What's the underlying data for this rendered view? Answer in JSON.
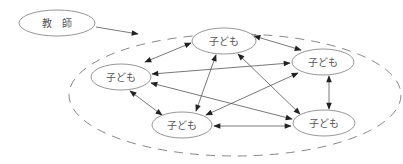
{
  "diagram": {
    "type": "relationship-diagram",
    "teacher": {
      "label": "教　師",
      "cx": 57,
      "cy": 23,
      "rx": 38,
      "ry": 13
    },
    "group": {
      "style": "dashed",
      "cx": 235,
      "cy": 95,
      "rx": 166,
      "ry": 61
    },
    "children": [
      {
        "id": "A",
        "label": "子ども",
        "cx": 224,
        "cy": 41,
        "rx": 32,
        "ry": 13
      },
      {
        "id": "B",
        "label": "子ども",
        "cx": 121,
        "cy": 77,
        "rx": 30,
        "ry": 13
      },
      {
        "id": "C",
        "label": "子ども",
        "cx": 323,
        "cy": 62,
        "rx": 31,
        "ry": 13
      },
      {
        "id": "D",
        "label": "子ども",
        "cx": 182,
        "cy": 125,
        "rx": 30,
        "ry": 13
      },
      {
        "id": "E",
        "label": "子ども",
        "cx": 324,
        "cy": 123,
        "rx": 31,
        "ry": 13
      }
    ],
    "edges": [
      {
        "from": "teacher",
        "to": "group",
        "type": "one-way",
        "x1": 96,
        "y1": 27,
        "x2": 138,
        "y2": 34
      },
      {
        "from": "A",
        "to": "C",
        "type": "two-way",
        "x1": 254,
        "y1": 36,
        "x2": 301,
        "y2": 50
      },
      {
        "from": "A",
        "to": "B",
        "type": "two-way",
        "x1": 191,
        "y1": 43,
        "x2": 145,
        "y2": 62
      },
      {
        "from": "A",
        "to": "D",
        "type": "two-way",
        "x1": 216,
        "y1": 55,
        "x2": 196,
        "y2": 111
      },
      {
        "from": "A",
        "to": "E",
        "type": "two-way",
        "x1": 238,
        "y1": 54,
        "x2": 300,
        "y2": 114
      },
      {
        "from": "B",
        "to": "C",
        "type": "two-way",
        "x1": 152,
        "y1": 74,
        "x2": 290,
        "y2": 63
      },
      {
        "from": "B",
        "to": "D",
        "type": "two-way",
        "x1": 130,
        "y1": 91,
        "x2": 162,
        "y2": 115
      },
      {
        "from": "B",
        "to": "E",
        "type": "two-way",
        "x1": 151,
        "y1": 83,
        "x2": 292,
        "y2": 119
      },
      {
        "from": "C",
        "to": "D",
        "type": "two-way",
        "x1": 298,
        "y1": 73,
        "x2": 206,
        "y2": 115
      },
      {
        "from": "C",
        "to": "E",
        "type": "two-way",
        "x1": 329,
        "y1": 76,
        "x2": 329,
        "y2": 109
      },
      {
        "from": "D",
        "to": "E",
        "type": "two-way",
        "x1": 214,
        "y1": 126,
        "x2": 291,
        "y2": 126
      }
    ]
  }
}
